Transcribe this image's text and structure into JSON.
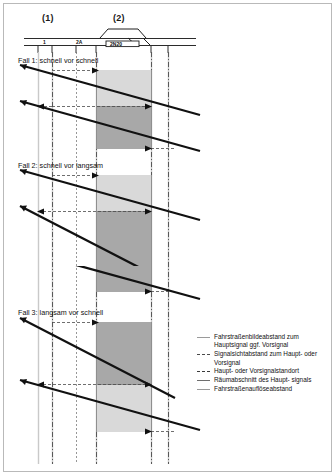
{
  "figure": {
    "type": "railway-time-distance-diagram",
    "columns": [
      {
        "id": "col1",
        "label": "(1)"
      },
      {
        "id": "col2",
        "label": "(2)"
      }
    ],
    "track_schematic": {
      "signal_labels": [
        {
          "text": "1",
          "x": 46
        },
        {
          "text": "2A",
          "x": 81
        },
        {
          "text": "2N20",
          "x": 120
        }
      ]
    },
    "cases": [
      {
        "id": "fall1",
        "label": "Fall 1: schnell vor schnell"
      },
      {
        "id": "fall2",
        "label": "Fall 2: schnell vor langsam"
      },
      {
        "id": "fall3",
        "label": "Fall 3: langsam vor schnell"
      }
    ],
    "legend": {
      "items": [
        {
          "style": "solid-grey",
          "text": "Fahrstraßenbildeabstand zum Hauptsignal ggf. Vorsignal"
        },
        {
          "style": "dash-dot",
          "text": "Signalsichtabstand zum Haupt- oder Vorsignal"
        },
        {
          "style": "dash-dot-2",
          "text": "Haupt- oder Vorsignalstandort"
        },
        {
          "style": "solid-dark",
          "text": "Räumabschnitt des Haupt- signals"
        },
        {
          "style": "solid-grey-2",
          "text": "Fahrstraßenauflöseabstand"
        }
      ]
    },
    "colors": {
      "band_light": "#d9d9d9",
      "band_dark": "#a8a8a8",
      "train_line": "#111111",
      "guide_grey": "#c9c9c9",
      "guide_dash": "#3b3b3b",
      "frame": "#b9b9b9"
    }
  }
}
